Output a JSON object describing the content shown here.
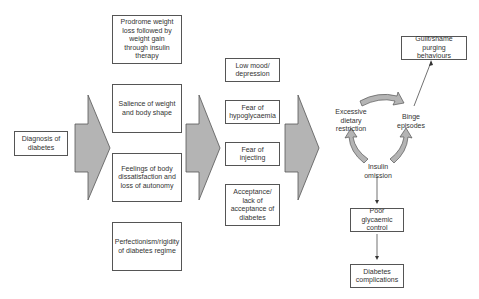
{
  "diagram": {
    "start": {
      "label": "Diagnosis of diabetes"
    },
    "column1": [
      {
        "label": "Prodrome weight loss followed by weight gain through insulin therapy"
      },
      {
        "label": "Salience of weight and body shape"
      },
      {
        "label": "Feelings of body dissatisfaction and loss of autonomy"
      },
      {
        "label": "Perfectionism/rigidity of diabetes regime"
      }
    ],
    "column2": [
      {
        "label": "Low mood/ depression"
      },
      {
        "label": "Fear of hypoglycaemia"
      },
      {
        "label": "Fear of injecting"
      },
      {
        "label": "Acceptance/ lack of acceptance of diabetes"
      }
    ],
    "cycle": {
      "restriction": "Excessive dietary restriction",
      "binge": "Binge episodes",
      "omission": "Insulin omission"
    },
    "outcomes": {
      "guilt": "Guilt/shame purging behaviours",
      "glycaemic": "Poor glycaemic control",
      "complications": "Diabetes complications"
    },
    "colors": {
      "arrow_fill": "#b4b4b4",
      "arrow_stroke": "#555555",
      "box_border": "#555555"
    }
  }
}
